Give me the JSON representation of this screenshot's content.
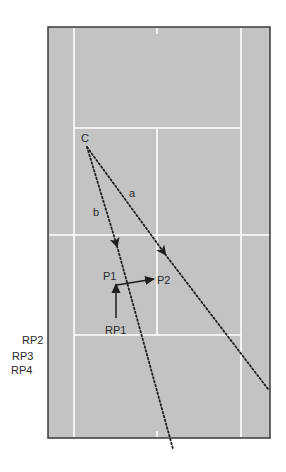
{
  "diagram": {
    "type": "tennis-court-drill",
    "colors": {
      "court": "#c3c3c3",
      "court_border": "#3a3a3a",
      "court_lines": "#ffffff",
      "paths": "#1e1e1e",
      "label_text": "#2a2a2a",
      "background": "#ffffff"
    },
    "labels": {
      "coach": "C",
      "shot_a": "a",
      "shot_b": "b",
      "player_1": "P1",
      "player_2": "P2",
      "rotation_1": "RP1",
      "rotation_2": "RP2",
      "rotation_3": "RP3",
      "rotation_4": "RP4"
    },
    "shots": [
      {
        "name": "a",
        "from": "C",
        "style": "dotted",
        "arrow": true
      },
      {
        "name": "b",
        "from": "C",
        "style": "dotted",
        "arrow": true
      }
    ],
    "movements": [
      {
        "from": "RP1",
        "to": "P1",
        "style": "solid"
      },
      {
        "from": "P1",
        "to": "P2",
        "style": "solid"
      }
    ]
  }
}
